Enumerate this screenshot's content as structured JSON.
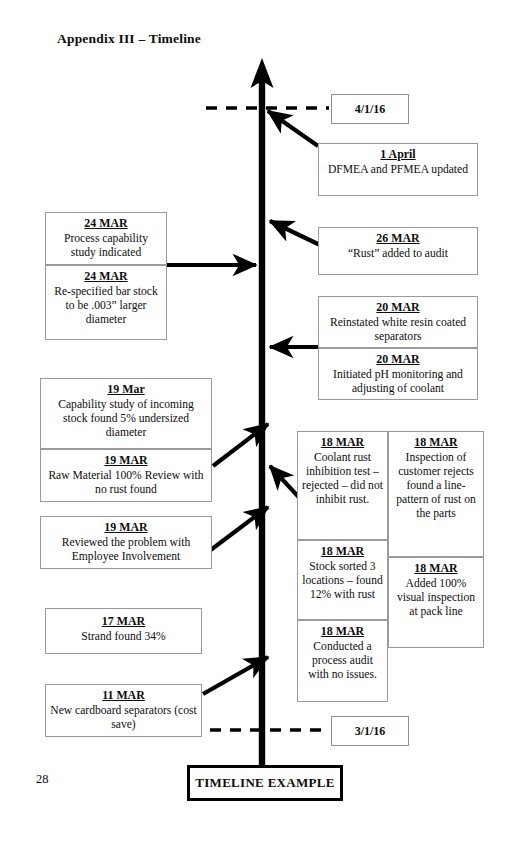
{
  "page": {
    "title": "Appendix III – Timeline",
    "number": "28",
    "caption": "TIMELINE EXAMPLE"
  },
  "axis": {
    "label_top": "4/1/16",
    "label_bottom": "3/1/16"
  },
  "events": {
    "april1": {
      "date": "1 April",
      "text": "DFMEA and PFMEA updated"
    },
    "mar26": {
      "date": "26  MAR",
      "text": "“Rust” added to audit"
    },
    "mar20a": {
      "date": "20 MAR",
      "text": "Reinstated white resin coated separators"
    },
    "mar20b": {
      "date": "20 MAR",
      "text": "Initiated pH monitoring and adjusting of coolant"
    },
    "mar24a": {
      "date": "24 MAR",
      "text": "Process capability study indicated"
    },
    "mar24b": {
      "date": "24 MAR",
      "text": "Re-specified bar stock to be .003” larger diameter"
    },
    "mar19a": {
      "date": "19 Mar",
      "text": "Capability study of incoming stock found 5% undersized diameter"
    },
    "mar19b": {
      "date": "19 MAR",
      "text": "Raw Material  100% Review with no rust found"
    },
    "mar19c": {
      "date": "19 MAR",
      "text": "Reviewed the problem with Employee Involvement"
    },
    "mar18a": {
      "date": "18  MAR",
      "text": "Coolant rust inhibition test – rejected – did not inhibit rust."
    },
    "mar18b": {
      "date": "18 MAR",
      "text": "Inspection of customer rejects found a line-pattern of rust on the parts"
    },
    "mar18c": {
      "date": "18 MAR",
      "text": "Stock sorted 3 locations – found 12% with rust"
    },
    "mar18d": {
      "date": "18 MAR",
      "text": "Added 100% visual inspection at pack line"
    },
    "mar18e": {
      "date": "18 MAR",
      "text": "Conducted a process audit with no issues."
    },
    "mar17": {
      "date": "17 MAR",
      "text": "Strand found 34%"
    },
    "mar11": {
      "date": "11 MAR",
      "text": "New cardboard separators (cost save)"
    }
  },
  "colors": {
    "ink": "#0d0d0d",
    "box_border": "#9a9a9a",
    "axis": "#000000",
    "paper": "#ffffff"
  }
}
